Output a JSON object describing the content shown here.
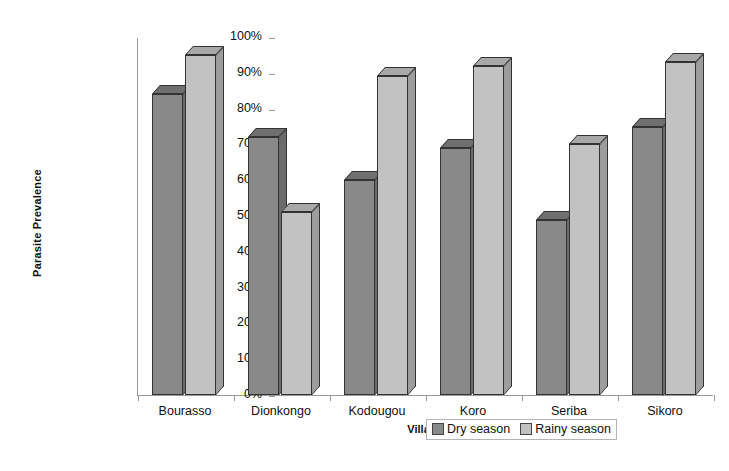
{
  "chart_data": {
    "type": "bar",
    "title": "",
    "xlabel": "Village",
    "ylabel": "Parasite Prevalence",
    "categories": [
      "Bourasso",
      "Dionkongo",
      "Kodougou",
      "Koro",
      "Seriba",
      "Sikoro"
    ],
    "series": [
      {
        "name": "Dry season",
        "values": [
          84,
          72,
          60,
          69,
          49,
          75
        ]
      },
      {
        "name": "Rainy season",
        "values": [
          95,
          51,
          89,
          92,
          70,
          93
        ]
      }
    ],
    "ylim": [
      0,
      100
    ],
    "ytick_labels": [
      "100%",
      "90%",
      "80%",
      "70%",
      "60%",
      "50%",
      "40%",
      "30%",
      "20%",
      "10%",
      "0%"
    ],
    "ytick_values": [
      100,
      90,
      80,
      70,
      60,
      50,
      40,
      30,
      20,
      10,
      0
    ],
    "grid": false,
    "legend_position": "bottom-right",
    "legend_entries": [
      "Dry season",
      "Rainy season"
    ],
    "colors": {
      "dry_season": "#898989",
      "rainy_season": "#c2c2c2",
      "axis": "#9a9a9a",
      "text": "#111111",
      "background": "#ffffff"
    }
  }
}
